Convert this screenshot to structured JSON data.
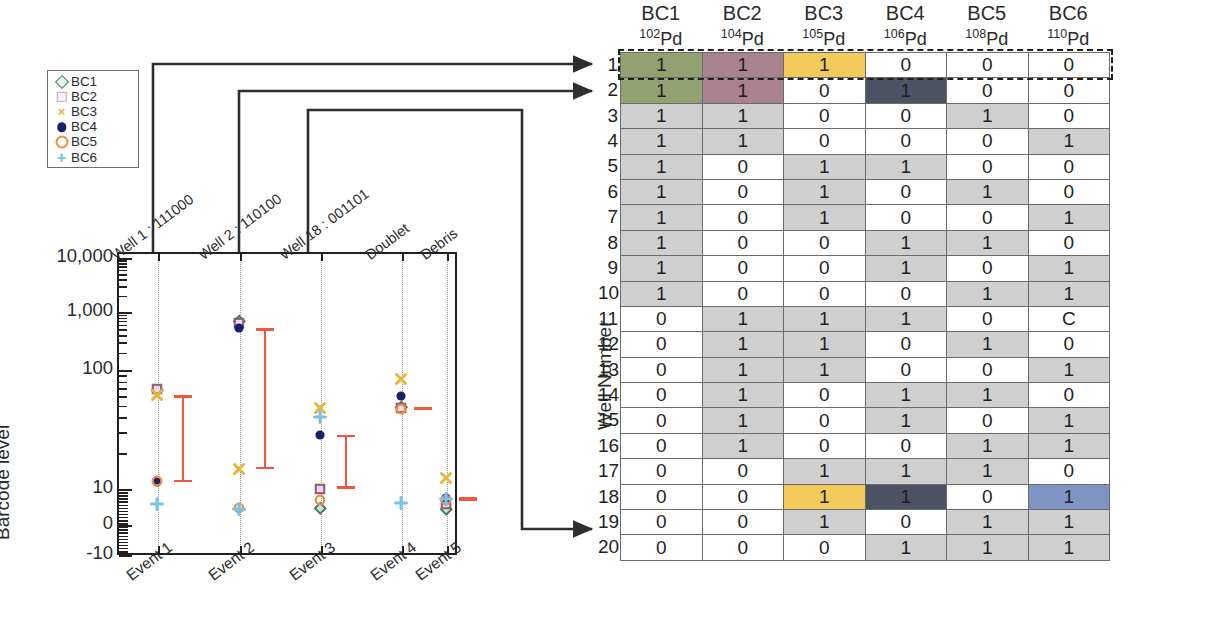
{
  "figure": {
    "left_panel": {
      "y_axis_label": "Barcode level",
      "y_ticks": [
        "10,000",
        "1,000",
        "100",
        "10",
        "0",
        "-10"
      ],
      "x_categories": [
        "Event 1",
        "Event 2",
        "Event 3",
        "Event 4",
        "Event 5"
      ],
      "top_annotations": [
        "Well 1 : 111000",
        "Well 2 : 110100",
        "Well 18 : 001101",
        "Doublet",
        "Debris"
      ],
      "legend": [
        {
          "label": "BC1",
          "marker": "diamond-marker",
          "color": "#3f7a5e"
        },
        {
          "label": "BC2",
          "marker": "square-marker",
          "color": "#c99ec3"
        },
        {
          "label": "BC3",
          "marker": "x-marker",
          "color": "#e8b53c"
        },
        {
          "label": "BC4",
          "marker": "filled-circle-marker",
          "color": "#1b1f6b"
        },
        {
          "label": "BC5",
          "marker": "open-circle-marker",
          "color": "#ef8b3d"
        },
        {
          "label": "BC6",
          "marker": "plus-marker",
          "color": "#74c3ea"
        }
      ],
      "errorbar_color": "#f2553d"
    },
    "right_panel": {
      "axis_label": "Well Number",
      "columns": [
        {
          "bc": "BC1",
          "mass": "102",
          "element": "Pd"
        },
        {
          "bc": "BC2",
          "mass": "104",
          "element": "Pd"
        },
        {
          "bc": "BC3",
          "mass": "105",
          "element": "Pd"
        },
        {
          "bc": "BC4",
          "mass": "106",
          "element": "Pd"
        },
        {
          "bc": "BC5",
          "mass": "108",
          "element": "Pd"
        },
        {
          "bc": "BC6",
          "mass": "110",
          "element": "Pd"
        }
      ],
      "row_labels": [
        "1",
        "2",
        "3",
        "4",
        "5",
        "6",
        "7",
        "8",
        "9",
        "10",
        "11",
        "12",
        "13",
        "14",
        "15",
        "16",
        "17",
        "18",
        "19",
        "20"
      ],
      "rows": [
        [
          "1",
          "1",
          "1",
          "0",
          "0",
          "0"
        ],
        [
          "1",
          "1",
          "0",
          "1",
          "0",
          "0"
        ],
        [
          "1",
          "1",
          "0",
          "0",
          "1",
          "0"
        ],
        [
          "1",
          "1",
          "0",
          "0",
          "0",
          "1"
        ],
        [
          "1",
          "0",
          "1",
          "1",
          "0",
          "0"
        ],
        [
          "1",
          "0",
          "1",
          "0",
          "1",
          "0"
        ],
        [
          "1",
          "0",
          "1",
          "0",
          "0",
          "1"
        ],
        [
          "1",
          "0",
          "0",
          "1",
          "1",
          "0"
        ],
        [
          "1",
          "0",
          "0",
          "1",
          "0",
          "1"
        ],
        [
          "1",
          "0",
          "0",
          "0",
          "1",
          "1"
        ],
        [
          "0",
          "1",
          "1",
          "1",
          "0",
          "C"
        ],
        [
          "0",
          "1",
          "1",
          "0",
          "1",
          "0"
        ],
        [
          "0",
          "1",
          "1",
          "0",
          "0",
          "1"
        ],
        [
          "0",
          "1",
          "0",
          "1",
          "1",
          "0"
        ],
        [
          "0",
          "1",
          "0",
          "1",
          "0",
          "1"
        ],
        [
          "0",
          "1",
          "0",
          "0",
          "1",
          "1"
        ],
        [
          "0",
          "0",
          "1",
          "1",
          "1",
          "0"
        ],
        [
          "0",
          "0",
          "1",
          "1",
          "0",
          "1"
        ],
        [
          "0",
          "0",
          "1",
          "0",
          "1",
          "1"
        ],
        [
          "0",
          "0",
          "0",
          "1",
          "1",
          "1"
        ]
      ],
      "highlights": [
        {
          "row": 1,
          "col": 1,
          "color": "#93a170"
        },
        {
          "row": 1,
          "col": 2,
          "color": "#a8828f"
        },
        {
          "row": 1,
          "col": 3,
          "color": "#f2cb5b"
        },
        {
          "row": 2,
          "col": 1,
          "color": "#93a170"
        },
        {
          "row": 2,
          "col": 2,
          "color": "#a8828f"
        },
        {
          "row": 2,
          "col": 4,
          "color": "#4d5264"
        },
        {
          "row": 18,
          "col": 3,
          "color": "#f2cb5b"
        },
        {
          "row": 18,
          "col": 4,
          "color": "#4d5264"
        },
        {
          "row": 18,
          "col": 6,
          "color": "#7f94c4"
        }
      ]
    }
  },
  "chart_data": {
    "type": "scatter",
    "title": "",
    "xlabel": "",
    "ylabel": "Barcode level",
    "scale": "symlog",
    "ylim": [
      -10,
      10000
    ],
    "ytick_values": [
      10000,
      1000,
      100,
      10,
      0,
      -10
    ],
    "grid": "vertical-dotted",
    "legend_position": "top-left-outside",
    "categories": [
      "Event 1",
      "Event 2",
      "Event 3",
      "Event 4",
      "Event 5"
    ],
    "category_annotations": [
      "Well 1 : 111000",
      "Well 2 : 110100",
      "Well 18 : 001101",
      "Doublet",
      "Debris"
    ],
    "series": [
      {
        "name": "BC1",
        "marker": "diamond",
        "color": "#3f7a5e",
        "values": [
          180,
          1450,
          4.2,
          110,
          4.0
        ]
      },
      {
        "name": "BC2",
        "marker": "square",
        "color": "#c99ec3",
        "values": [
          185,
          1350,
          9.5,
          105,
          5.2
        ]
      },
      {
        "name": "BC3",
        "marker": "x",
        "color": "#e8b53c",
        "values": [
          155,
          17,
          105,
          250,
          13.0
        ]
      },
      {
        "name": "BC4",
        "marker": "filled-circle",
        "color": "#1b1f6b",
        "values": [
          11.5,
          1150,
          48,
          150,
          7.0
        ]
      },
      {
        "name": "BC5",
        "marker": "open-circle",
        "color": "#ef8b3d",
        "values": [
          12.0,
          4.3,
          6.5,
          103,
          6.3
        ]
      },
      {
        "name": "BC6",
        "marker": "plus",
        "color": "#74c3ea",
        "values": [
          5.2,
          4.0,
          80,
          5.5,
          6.8
        ]
      }
    ],
    "errorbars": [
      {
        "category": "Event 1",
        "low": 11.5,
        "high": 155
      },
      {
        "category": "Event 2",
        "low": 17,
        "high": 1150
      },
      {
        "category": "Event 3",
        "low": 9.5,
        "high": 48
      },
      {
        "category": "Event 4",
        "low": 100,
        "high": 110
      },
      {
        "category": "Event 5",
        "low": 6.0,
        "high": 7.2
      }
    ],
    "errorbar_color": "#f2553d"
  }
}
